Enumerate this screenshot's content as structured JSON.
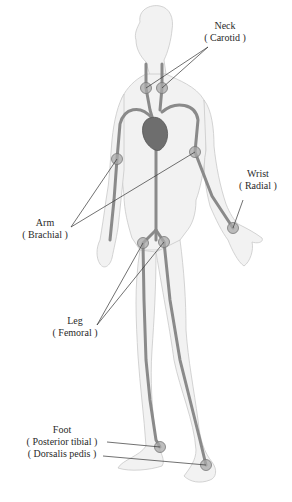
{
  "diagram": {
    "colors": {
      "skin_fill": "#f1f1f1",
      "skin_outline": "#c8c8c8",
      "artery": "#8a8a8a",
      "heart": "#6e6e6e",
      "pulse_point": "#9a9a9a",
      "leader_line": "#333333",
      "text": "#2a2a2a"
    },
    "labels": {
      "neck": {
        "name": "Neck",
        "artery": "( Carotid )"
      },
      "wrist": {
        "name": "Wrist",
        "artery": "( Radial )"
      },
      "arm": {
        "name": "Arm",
        "artery": "( Brachial )"
      },
      "leg": {
        "name": "Leg",
        "artery": "( Femoral )"
      },
      "foot": {
        "name": "Foot",
        "artery_1": "( Posterior tibial )",
        "artery_2": "( Dorsalis pedis )"
      }
    },
    "pulse_points": [
      {
        "id": "carotid-right",
        "x": 146,
        "y": 88
      },
      {
        "id": "carotid-left",
        "x": 162,
        "y": 88
      },
      {
        "id": "brachial-right",
        "x": 117,
        "y": 159
      },
      {
        "id": "brachial-left",
        "x": 195,
        "y": 152
      },
      {
        "id": "radial",
        "x": 233,
        "y": 228
      },
      {
        "id": "femoral-right",
        "x": 143,
        "y": 243
      },
      {
        "id": "femoral-left",
        "x": 164,
        "y": 242
      },
      {
        "id": "posterior-tibial",
        "x": 160,
        "y": 447
      },
      {
        "id": "dorsalis-pedis",
        "x": 206,
        "y": 465
      }
    ]
  }
}
